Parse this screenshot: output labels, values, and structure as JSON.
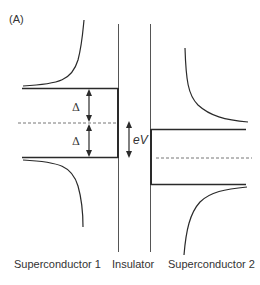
{
  "panel_label": "(A)",
  "labels": {
    "sc1": "Superconductor 1",
    "insulator": "Insulator",
    "sc2": "Superconductor 2",
    "delta_upper": "Δ",
    "delta_lower": "Δ",
    "ev": "eV"
  },
  "colors": {
    "line": "#2a2a2a",
    "dashed": "#777777"
  }
}
